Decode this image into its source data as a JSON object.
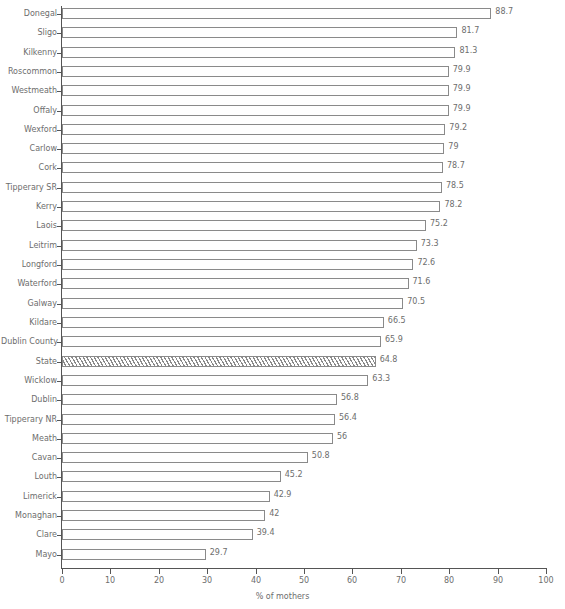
{
  "chart_data": {
    "type": "bar",
    "orientation": "horizontal",
    "title": "",
    "xlabel": "% of mothers",
    "ylabel": "",
    "xlim": [
      0,
      100
    ],
    "xticks": [
      0,
      10,
      20,
      30,
      40,
      50,
      60,
      70,
      80,
      90,
      100
    ],
    "grid": false,
    "legend": null,
    "categories": [
      "Donegal",
      "Sligo",
      "Kilkenny",
      "Roscommon",
      "Westmeath",
      "Offaly",
      "Wexford",
      "Carlow",
      "Cork",
      "Tipperary SR",
      "Kerry",
      "Laois",
      "Leitrim",
      "Longford",
      "Waterford",
      "Galway",
      "Kildare",
      "Dublin County",
      "State",
      "Wicklow",
      "Dublin",
      "Tipperary NR",
      "Meath",
      "Cavan",
      "Louth",
      "Limerick",
      "Monaghan",
      "Clare",
      "Mayo"
    ],
    "values": [
      88.7,
      81.7,
      81.3,
      79.9,
      79.9,
      79.9,
      79.2,
      79,
      78.7,
      78.5,
      78.2,
      75.2,
      73.3,
      72.6,
      71.6,
      70.5,
      66.5,
      65.9,
      64.8,
      63.3,
      56.8,
      56.4,
      56,
      50.8,
      45.2,
      42.9,
      42,
      39.4,
      29.7
    ],
    "value_labels": [
      "88.7",
      "81.7",
      "81.3",
      "79.9",
      "79.9",
      "79.9",
      "79.2",
      "79",
      "78.7",
      "78.5",
      "78.2",
      "75.2",
      "73.3",
      "72.6",
      "71.6",
      "70.5",
      "66.5",
      "65.9",
      "64.8",
      "63.3",
      "56.8",
      "56.4",
      "56",
      "50.8",
      "45.2",
      "42.9",
      "42",
      "39.4",
      "29.7"
    ],
    "highlighted_category": "State",
    "highlight_style": "diagonal-hatch",
    "bar_fill": "#ffffff",
    "bar_edge": "#8a8a8a",
    "axis_color": "#555555",
    "text_color": "#6d6d6d"
  }
}
